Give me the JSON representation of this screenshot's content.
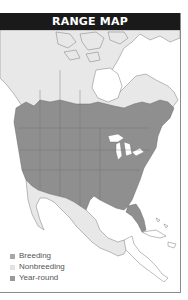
{
  "header": {
    "title": "RANGE MAP"
  },
  "map": {
    "region": "North America",
    "colors": {
      "water": "#ffffff",
      "land": "#ffffff",
      "borders": "#7a7a7a",
      "breeding": "#cfcfcf",
      "nonbreeding": "#e8e8e8",
      "year_round": "#8f8f8f"
    }
  },
  "legend": {
    "items": [
      {
        "label": "Breeding",
        "color": "#a8a8a8"
      },
      {
        "label": "Nonbreeding",
        "color": "#e2e2e2"
      },
      {
        "label": "Year-round",
        "color": "#9a9a9a"
      }
    ]
  }
}
